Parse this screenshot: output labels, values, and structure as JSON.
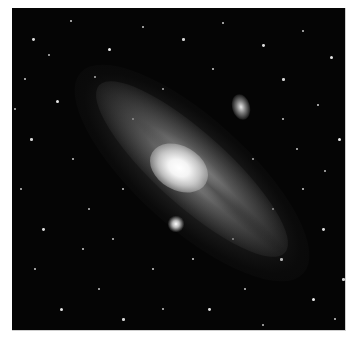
{
  "image": {
    "subject": "Andromeda galaxy with satellite galaxies in a star field",
    "style": "grayscale astrophotograph",
    "colors": {
      "page_background": "#ffffff",
      "sky": "#050505",
      "core": "#ffffff"
    },
    "objects": [
      {
        "name": "andromeda-galaxy-core",
        "x": 167,
        "y": 160
      },
      {
        "name": "satellite-galaxy-upper-right",
        "x": 229,
        "y": 99
      },
      {
        "name": "satellite-galaxy-below-core",
        "x": 164,
        "y": 216
      }
    ],
    "stars": [
      [
        20,
        30,
        1.4
      ],
      [
        58,
        12,
        1.2
      ],
      [
        96,
        40,
        1.6
      ],
      [
        130,
        18,
        1.1
      ],
      [
        170,
        30,
        1.3
      ],
      [
        210,
        14,
        1.2
      ],
      [
        250,
        36,
        1.4
      ],
      [
        290,
        22,
        1.1
      ],
      [
        318,
        48,
        1.5
      ],
      [
        12,
        70,
        1.2
      ],
      [
        44,
        92,
        1.5
      ],
      [
        82,
        68,
        1.1
      ],
      [
        270,
        70,
        1.3
      ],
      [
        305,
        96,
        1.2
      ],
      [
        326,
        130,
        1.6
      ],
      [
        284,
        140,
        1.1
      ],
      [
        18,
        130,
        1.3
      ],
      [
        8,
        180,
        1.1
      ],
      [
        30,
        220,
        1.4
      ],
      [
        22,
        260,
        1.2
      ],
      [
        48,
        300,
        1.5
      ],
      [
        86,
        280,
        1.1
      ],
      [
        110,
        310,
        1.3
      ],
      [
        140,
        260,
        1.2
      ],
      [
        196,
        300,
        1.4
      ],
      [
        232,
        280,
        1.1
      ],
      [
        268,
        250,
        1.3
      ],
      [
        300,
        290,
        1.6
      ],
      [
        322,
        310,
        1.2
      ],
      [
        310,
        220,
        1.4
      ],
      [
        290,
        180,
        1.2
      ],
      [
        260,
        200,
        1.1
      ],
      [
        70,
        240,
        1.2
      ],
      [
        100,
        230,
        1.0
      ],
      [
        60,
        150,
        1.1
      ],
      [
        240,
        150,
        1.0
      ],
      [
        200,
        60,
        1.2
      ],
      [
        150,
        80,
        1.0
      ],
      [
        120,
        110,
        1.1
      ],
      [
        36,
        46,
        1.0
      ],
      [
        180,
        250,
        1.2
      ],
      [
        220,
        230,
        1.1
      ],
      [
        110,
        180,
        1.0
      ],
      [
        270,
        110,
        1.1
      ],
      [
        312,
        162,
        1.0
      ],
      [
        150,
        300,
        1.1
      ],
      [
        250,
        316,
        1.0
      ],
      [
        330,
        270,
        1.3
      ],
      [
        2,
        100,
        1.0
      ],
      [
        76,
        200,
        1.0
      ]
    ]
  }
}
